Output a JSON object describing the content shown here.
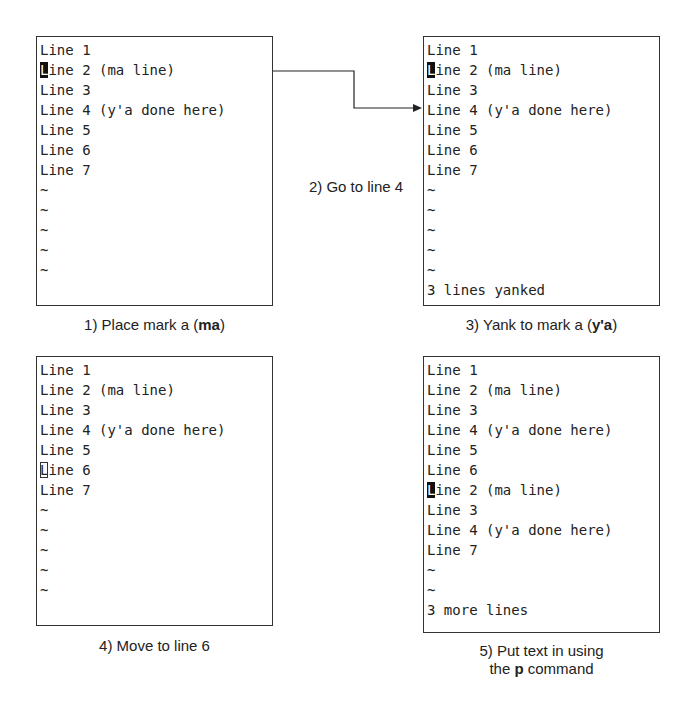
{
  "panels": [
    {
      "id": "step1",
      "lines": [
        "Line 1",
        "Line 2 (ma line)",
        "Line 3",
        "Line 4 (y'a done here)",
        "Line 5",
        "Line 6",
        "Line 7",
        "~",
        "~",
        "~",
        "~",
        "~",
        ""
      ],
      "cursor": {
        "row": 1,
        "style": "block"
      },
      "caption": {
        "prefix": "1) Place mark a (",
        "bold": "ma",
        "suffix": ")"
      }
    },
    {
      "id": "step3",
      "lines": [
        "Line 1",
        "Line 2 (ma line)",
        "Line 3",
        "Line 4 (y'a done here)",
        "Line 5",
        "Line 6",
        "Line 7",
        "~",
        "~",
        "~",
        "~",
        "~",
        "3 lines yanked"
      ],
      "cursor": {
        "row": 1,
        "style": "block"
      },
      "caption": {
        "prefix": "3) Yank to mark a (",
        "bold": "y'a",
        "suffix": ")"
      }
    },
    {
      "id": "step4",
      "lines": [
        "Line 1",
        "Line 2 (ma line)",
        "Line 3",
        "Line 4 (y'a done here)",
        "Line 5",
        "Line 6",
        "Line 7",
        "~",
        "~",
        "~",
        "~",
        "~",
        ""
      ],
      "cursor": {
        "row": 5,
        "style": "hollow"
      },
      "caption": {
        "prefix": "4) Move to line 6",
        "bold": "",
        "suffix": ""
      }
    },
    {
      "id": "step5",
      "lines": [
        "Line 1",
        "Line 2 (ma line)",
        "Line 3",
        "Line 4 (y'a done here)",
        "Line 5",
        "Line 6",
        "Line 2 (ma line)",
        "Line 3",
        "Line 4 (y'a done here)",
        "Line 7",
        "~",
        "~",
        "3 more lines"
      ],
      "cursor": {
        "row": 6,
        "style": "block"
      },
      "caption": {
        "line1": "5) Put text in using",
        "prefix": "the ",
        "bold": "p",
        "suffix": " command"
      }
    }
  ],
  "step2_label": "2) Go to line 4",
  "colors": {
    "border": "#333333",
    "text": "#222222",
    "cursor": "#111111"
  }
}
